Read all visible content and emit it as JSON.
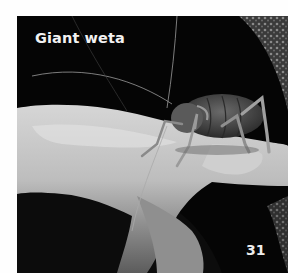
{
  "page": {
    "title": "Giant weta",
    "page_number": "31"
  },
  "photo": {
    "subject": "giant weta insect on a human hand",
    "style": "black-and-white photograph",
    "colors": {
      "background": "#050505",
      "hand": "#b9b9b9",
      "hand_highlight": "#e4e4e4",
      "insect": "#4a4a4a",
      "foliage": "#6b6b6b"
    }
  }
}
